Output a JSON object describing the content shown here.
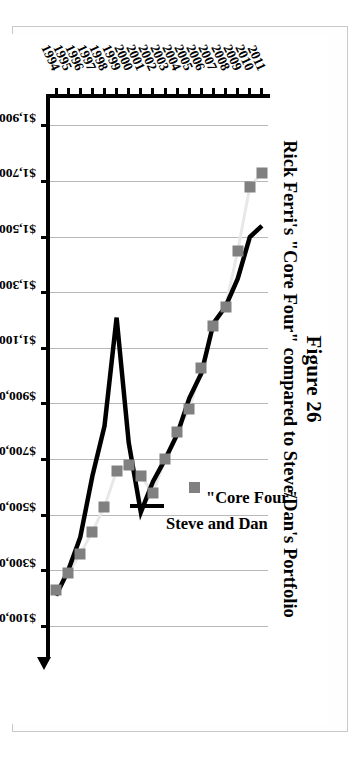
{
  "figure": {
    "title": "Figure 26",
    "subtitle": "Rick Ferri's \"Core Four\" compared to Steve/Dan's Portfolio"
  },
  "chart_data": {
    "type": "line",
    "title": "Rick Ferri's \"Core Four\" compared to Steve/Dan's Portfolio",
    "xlabel": "",
    "ylabel": "Portfolio Values",
    "grid": true,
    "legend_position": "inside-right",
    "orientation": "rotated-90-on-page",
    "categories": [
      "1994",
      "1995",
      "1996",
      "1997",
      "1998",
      "1999",
      "2000",
      "2001",
      "2002",
      "2003",
      "2004",
      "2005",
      "2006",
      "2007",
      "2008",
      "2009",
      "2010",
      "2011"
    ],
    "ylim": [
      100000,
      1900000
    ],
    "ytick_labels": [
      "$1,900,000",
      "$1,700,000",
      "$1,500,000",
      "$1,300,000",
      "$1,100,000",
      "$900,000",
      "$700,000",
      "$500,000",
      "$300,000",
      "$100,000"
    ],
    "ytick_values": [
      1900000,
      1700000,
      1500000,
      1300000,
      1100000,
      900000,
      700000,
      500000,
      300000,
      100000
    ],
    "series": [
      {
        "name": "\"Core Four\"",
        "marker": "square",
        "color": "#808080",
        "line_color": "#e8e8e8",
        "values": [
          230000,
          290000,
          360000,
          440000,
          530000,
          660000,
          680000,
          640000,
          580000,
          700000,
          800000,
          880000,
          1030000,
          1180000,
          1250000,
          1450000,
          1680000,
          1730000
        ]
      },
      {
        "name": "Steve and Dan",
        "marker": "none",
        "color": "#000000",
        "line_color": "#000000",
        "values": [
          210000,
          300000,
          420000,
          640000,
          820000,
          1210000,
          760000,
          510000,
          620000,
          700000,
          790000,
          920000,
          1010000,
          1190000,
          1250000,
          1350000,
          1500000,
          1540000
        ]
      }
    ]
  },
  "legend": {
    "items": [
      {
        "label": "\"Core Four\"",
        "swatch": "square-marker",
        "color": "#808080"
      },
      {
        "label": "Steve and Dan",
        "swatch": "line",
        "color": "#000000"
      }
    ]
  },
  "axes": {
    "value_axis_title": "Portfolio Values"
  }
}
